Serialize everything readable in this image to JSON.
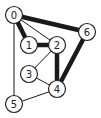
{
  "graph": {
    "nodes": [
      {
        "id": "0",
        "label": "0",
        "x": 14,
        "y": 15
      },
      {
        "id": "1",
        "label": "1",
        "x": 29,
        "y": 45
      },
      {
        "id": "2",
        "label": "2",
        "x": 57,
        "y": 45
      },
      {
        "id": "3",
        "label": "3",
        "x": 29,
        "y": 74
      },
      {
        "id": "4",
        "label": "4",
        "x": 57,
        "y": 89
      },
      {
        "id": "5",
        "label": "5",
        "x": 14,
        "y": 104
      },
      {
        "id": "6",
        "label": "6",
        "x": 87,
        "y": 32
      }
    ],
    "edges": [
      {
        "from": "0",
        "to": "6",
        "weight": "thick"
      },
      {
        "from": "0",
        "to": "1",
        "weight": "thick"
      },
      {
        "from": "0",
        "to": "2",
        "weight": "thin"
      },
      {
        "from": "0",
        "to": "5",
        "weight": "thin"
      },
      {
        "from": "1",
        "to": "2",
        "weight": "thick"
      },
      {
        "from": "2",
        "to": "4",
        "weight": "thick"
      },
      {
        "from": "6",
        "to": "4",
        "weight": "thick"
      },
      {
        "from": "2",
        "to": "3",
        "weight": "thin"
      },
      {
        "from": "3",
        "to": "4",
        "weight": "thin"
      },
      {
        "from": "5",
        "to": "4",
        "weight": "thin"
      }
    ],
    "colors": {
      "stroke": "#1a1a1a",
      "node_fill": "#ffffff"
    }
  }
}
